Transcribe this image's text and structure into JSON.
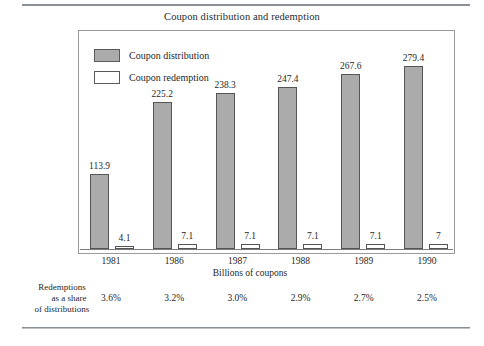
{
  "figure": {
    "title": "Coupon distribution and redemption",
    "axis_title": "Billions of coupons",
    "annotation_lines": [
      "Redemptions",
      "as a share",
      "of distributions"
    ],
    "colors": {
      "distribution_fill": "#ababab",
      "redemption_fill": "#ffffff",
      "bar_outline": "#555555",
      "frame": "#9a9a9a",
      "rule": "#8a8e96",
      "text": "#1f1f1f"
    }
  },
  "legend": {
    "items": [
      {
        "label": "Coupon distribution",
        "swatch": "filled"
      },
      {
        "label": "Coupon redemption",
        "swatch": "hollow"
      }
    ]
  },
  "chart_data": {
    "type": "bar",
    "title": "Coupon distribution and redemption",
    "xlabel": "Billions of coupons",
    "ylabel": "",
    "grid": false,
    "legend_position": "top-left-inside",
    "ylim": [
      0,
      300
    ],
    "categories": [
      "1981",
      "1986",
      "1987",
      "1988",
      "1989",
      "1990"
    ],
    "series": [
      {
        "name": "Coupon distribution",
        "values": [
          113.9,
          225.2,
          238.3,
          247.4,
          267.6,
          279.4
        ],
        "labels": [
          "113.9",
          "225.2",
          "238.3",
          "247.4",
          "267.6",
          "279.4"
        ]
      },
      {
        "name": "Coupon redemption",
        "values": [
          4.1,
          7.1,
          7.1,
          7.1,
          7.1,
          7
        ],
        "labels": [
          "4.1",
          "7.1",
          "7.1",
          "7.1",
          "7.1",
          "7"
        ]
      }
    ],
    "annotations": {
      "row_label": "Redemptions as a share of distributions",
      "row_values": [
        "3.6%",
        "3.2%",
        "3.0%",
        "2.9%",
        "2.7%",
        "2.5%"
      ]
    }
  }
}
